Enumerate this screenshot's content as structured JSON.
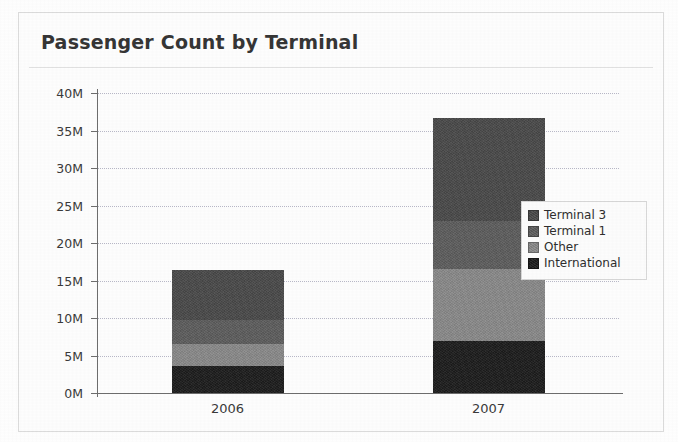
{
  "chart_data": {
    "type": "bar",
    "subtype": "stacked-bar",
    "title": "Passenger Count by Terminal",
    "xlabel": "",
    "ylabel": "",
    "categories": [
      "2006",
      "2007"
    ],
    "ylim": [
      0,
      40000000
    ],
    "ytick_values": [
      0,
      5000000,
      10000000,
      15000000,
      20000000,
      25000000,
      30000000,
      35000000,
      40000000
    ],
    "ytick_labels": [
      "0M",
      "5M",
      "10M",
      "15M",
      "20M",
      "25M",
      "30M",
      "35M",
      "40M"
    ],
    "grid": true,
    "grid_axis": "y",
    "legend_position": "right",
    "stack_order_bottom_to_top": [
      "International",
      "Other",
      "Terminal 1",
      "Terminal 3"
    ],
    "series": [
      {
        "name": "Terminal 3",
        "color": "#4a4a4a",
        "values": [
          6600000,
          13700000
        ]
      },
      {
        "name": "Terminal 1",
        "color": "#5e5e5e",
        "values": [
          3300000,
          6500000
        ]
      },
      {
        "name": "Other",
        "color": "#8a8a8a",
        "values": [
          2900000,
          9500000
        ]
      },
      {
        "name": "International",
        "color": "#1c1c1c",
        "values": [
          3600000,
          7000000
        ]
      }
    ],
    "totals": [
      16400000,
      36700000
    ]
  },
  "legend": {
    "items": [
      {
        "label": "Terminal 3",
        "color": "#4a4a4a"
      },
      {
        "label": "Terminal 1",
        "color": "#5e5e5e"
      },
      {
        "label": "Other",
        "color": "#8a8a8a"
      },
      {
        "label": "International",
        "color": "#1c1c1c"
      }
    ]
  }
}
